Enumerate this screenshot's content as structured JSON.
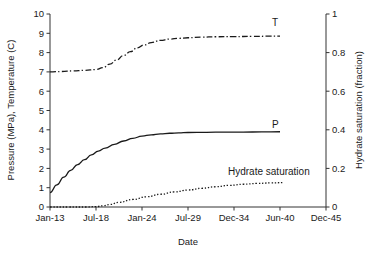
{
  "chart_data": {
    "type": "line",
    "title": "",
    "xlabel": "Date",
    "ylabel": "Pressure (MPa), Temperature (C)",
    "y2label": "Hydrate saturation (fraction)",
    "grid": false,
    "legend_position": "inline-end-of-curve",
    "x_categories": [
      "Jan-13",
      "Jul-18",
      "Jan-24",
      "Jul-29",
      "Dec-34",
      "Jun-40",
      "Dec-45"
    ],
    "x_tick_values": [
      0,
      1,
      2,
      3,
      4,
      5,
      6
    ],
    "xlim": [
      0,
      6
    ],
    "ylim": [
      0,
      10
    ],
    "y_ticks": [
      0,
      1,
      2,
      3,
      4,
      5,
      6,
      7,
      8,
      9,
      10
    ],
    "y2lim": [
      0,
      1
    ],
    "y2_ticks": [
      0,
      0.2,
      0.4,
      0.6,
      0.8,
      1
    ],
    "y2_tick_labels": [
      "0",
      "0.2",
      "0.4",
      "0.6",
      "0.8",
      "1"
    ],
    "series": [
      {
        "name": "T",
        "label": "T",
        "axis": "left",
        "style": "dash-dot",
        "color": "#1a1a1a",
        "units": "C",
        "x": [
          0.0,
          0.25,
          0.5,
          0.75,
          1.0,
          1.15,
          1.3,
          1.45,
          1.6,
          1.75,
          1.9,
          2.05,
          2.2,
          2.4,
          2.6,
          2.8,
          3.0,
          3.3,
          3.6,
          4.0,
          4.4,
          4.8,
          5.0
        ],
        "values": [
          7.0,
          7.02,
          7.05,
          7.08,
          7.12,
          7.22,
          7.4,
          7.62,
          7.85,
          8.05,
          8.25,
          8.4,
          8.52,
          8.63,
          8.7,
          8.74,
          8.77,
          8.8,
          8.82,
          8.83,
          8.84,
          8.85,
          8.85
        ]
      },
      {
        "name": "P",
        "label": "P",
        "axis": "left",
        "style": "solid",
        "color": "#1a1a1a",
        "units": "MPa",
        "x": [
          0.0,
          0.15,
          0.3,
          0.45,
          0.6,
          0.75,
          0.9,
          1.05,
          1.2,
          1.4,
          1.6,
          1.8,
          2.0,
          2.2,
          2.4,
          2.6,
          2.8,
          3.0,
          3.4,
          3.8,
          4.2,
          4.6,
          5.0
        ],
        "values": [
          0.75,
          1.15,
          1.55,
          1.9,
          2.2,
          2.45,
          2.7,
          2.9,
          3.05,
          3.25,
          3.42,
          3.56,
          3.67,
          3.74,
          3.79,
          3.82,
          3.84,
          3.86,
          3.87,
          3.88,
          3.88,
          3.89,
          3.9
        ]
      },
      {
        "name": "Hydrate saturation",
        "label": "Hydrate saturation",
        "axis": "right",
        "style": "dotted",
        "color": "#1a1a1a",
        "units": "fraction",
        "x": [
          0.0,
          0.4,
          0.8,
          1.0,
          1.15,
          1.3,
          1.5,
          1.8,
          2.1,
          2.4,
          2.7,
          3.0,
          3.3,
          3.6,
          3.9,
          4.2,
          4.5,
          4.8,
          5.05
        ],
        "values": [
          0.0,
          0.0,
          0.0,
          0.002,
          0.006,
          0.013,
          0.024,
          0.039,
          0.053,
          0.066,
          0.078,
          0.088,
          0.097,
          0.105,
          0.112,
          0.118,
          0.122,
          0.125,
          0.126
        ]
      }
    ],
    "annotations": [
      {
        "text": "T",
        "x_px": 272,
        "y_px": 26
      },
      {
        "text": "P",
        "x_px": 272,
        "y_px": 128
      },
      {
        "text": "Hydrate saturation",
        "x_px": 228,
        "y_px": 175
      }
    ]
  },
  "axes": {
    "x_title": "Date",
    "y_left_title": "Pressure (MPa), Temperature (C)",
    "y_right_title": "Hydrate saturation (fraction)"
  },
  "colors": {
    "axis": "#333333",
    "curve": "#1a1a1a",
    "background": "#ffffff"
  }
}
